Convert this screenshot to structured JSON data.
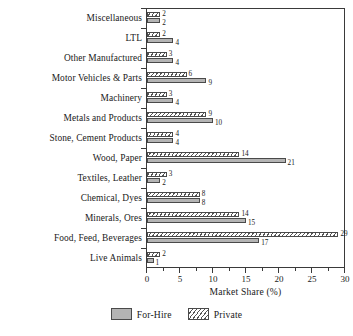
{
  "chart_data": {
    "type": "bar",
    "orientation": "horizontal",
    "title": "",
    "xlabel": "Market Share (%)",
    "ylabel": "",
    "xlim": [
      0,
      30
    ],
    "xticks": [
      0,
      5,
      10,
      15,
      20,
      25,
      30
    ],
    "xtick_labels": [
      "0",
      "5",
      "10",
      "15",
      "20",
      "25",
      "30"
    ],
    "minor_tick_interval": 2.5,
    "grid": false,
    "legend_position": "bottom-center",
    "categories": [
      "Miscellaneous",
      "LTL",
      "Other Manufactured",
      "Motor Vehicles & Parts",
      "Machinery",
      "Metals and Products",
      "Stone, Cement Products",
      "Wood, Paper",
      "Textiles, Leather",
      "Chemical, Dyes",
      "Minerals, Ores",
      "Food, Feed, Beverages",
      "Live Animals"
    ],
    "series": [
      {
        "name": "Private",
        "color": "#ffffff",
        "pattern": "diagonal-hatch",
        "values": [
          2,
          2,
          3,
          6,
          3,
          9,
          4,
          14,
          3,
          8,
          14,
          29,
          2
        ]
      },
      {
        "name": "For-Hire",
        "color": "#b4b4b4",
        "pattern": "solid",
        "values": [
          2,
          4,
          4,
          9,
          4,
          10,
          4,
          21,
          2,
          8,
          15,
          17,
          1
        ]
      }
    ],
    "value_labels": {
      "Miscellaneous": {
        "private": "2",
        "forhire": "2"
      },
      "LTL": {
        "private": "2",
        "forhire": "4"
      },
      "Other Manufactured": {
        "private": "3",
        "forhire": "4"
      },
      "Motor Vehicles & Parts": {
        "private": "6",
        "forhire": "9"
      },
      "Machinery": {
        "private": "3",
        "forhire": "4"
      },
      "Metals and Products": {
        "private": "9",
        "forhire": "10"
      },
      "Stone, Cement Products": {
        "private": "4",
        "forhire": "4"
      },
      "Wood, Paper": {
        "private": "14",
        "forhire": "21"
      },
      "Textiles, Leather": {
        "private": "3",
        "forhire": "2"
      },
      "Chemical, Dyes": {
        "private": "8",
        "forhire": "8"
      },
      "Minerals, Ores": {
        "private": "14",
        "forhire": "15"
      },
      "Food, Feed, Beverages": {
        "private": "29",
        "forhire": "17"
      },
      "Live Animals": {
        "private": "2",
        "forhire": "1"
      }
    }
  },
  "legend": {
    "items": [
      {
        "label": "For-Hire",
        "swatch": "forhire"
      },
      {
        "label": "Private",
        "swatch": "private"
      }
    ]
  }
}
